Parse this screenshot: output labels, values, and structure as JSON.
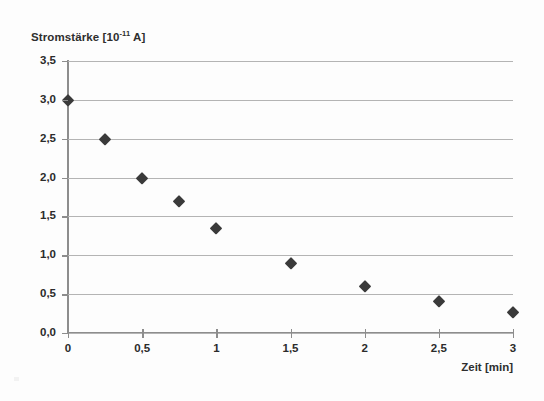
{
  "chart_data": {
    "type": "scatter",
    "title": "",
    "ylabel": "Stromstärke [10-11 A]",
    "ylabel_base": "Stromstärke [10",
    "ylabel_exponent": "-11",
    "ylabel_suffix": " A]",
    "xlabel": "Zeit [min]",
    "xlim": [
      0,
      3
    ],
    "ylim": [
      0,
      3.5
    ],
    "grid": true,
    "legend": "none",
    "marker": "diamond",
    "marker_color": "#3a3a3a",
    "gridline_color": "#b4b4b4",
    "axis_color": "#8d8d8d",
    "x_tick_labels": [
      "0",
      "0,5",
      "1",
      "1,5",
      "2",
      "2,5",
      "3"
    ],
    "x_tick_values": [
      0,
      0.5,
      1,
      1.5,
      2,
      2.5,
      3
    ],
    "y_tick_labels": [
      "0,0",
      "0,5",
      "1,0",
      "1,5",
      "2,0",
      "2,5",
      "3,0",
      "3,5"
    ],
    "y_tick_values": [
      0,
      0.5,
      1.0,
      1.5,
      2.0,
      2.5,
      3.0,
      3.5
    ],
    "x": [
      0,
      0.25,
      0.5,
      0.75,
      1.0,
      1.5,
      2.0,
      2.5,
      3.0
    ],
    "values": [
      3.0,
      2.49,
      2.0,
      1.7,
      1.35,
      0.9,
      0.6,
      0.41,
      0.27
    ],
    "points": [
      {
        "x": 0,
        "y": 3.0
      },
      {
        "x": 0.25,
        "y": 2.49
      },
      {
        "x": 0.5,
        "y": 2.0
      },
      {
        "x": 0.75,
        "y": 1.7
      },
      {
        "x": 1.0,
        "y": 1.35
      },
      {
        "x": 1.5,
        "y": 0.9
      },
      {
        "x": 2.0,
        "y": 0.6
      },
      {
        "x": 2.5,
        "y": 0.41
      },
      {
        "x": 3.0,
        "y": 0.27
      }
    ]
  }
}
